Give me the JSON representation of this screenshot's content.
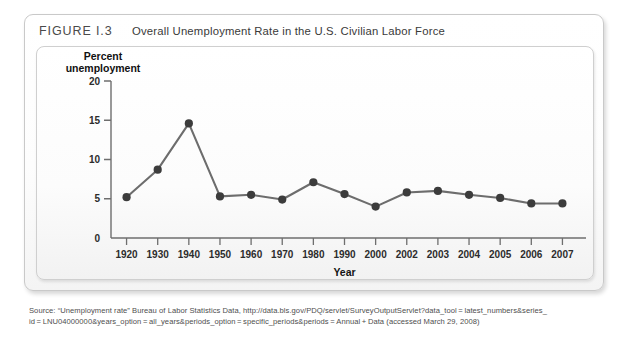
{
  "figure": {
    "number": "FIGURE I.3",
    "title": "Overall Unemployment Rate in the U.S. Civilian Labor Force"
  },
  "source": {
    "line1": "Source: “Unemployment rate” Bureau of Labor Statistics Data, http://data.bls.gov/PDQ/servlet/SurveyOutputServlet?data_tool = latest_numbers&series_",
    "line2": "id = LNU04000000&years_option = all_years&periods_option = specific_periods&periods = Annual + Data (accessed March 29, 2008)"
  },
  "colors": {
    "line": "#6d6d6d",
    "marker": "#3c3c3c",
    "axis": "#6e6e6e",
    "frame_border": "#c9c9c9",
    "panel_border": "#cfcfcf"
  },
  "chart_data": {
    "type": "line",
    "title": "Overall Unemployment Rate in the U.S. Civilian Labor Force",
    "xlabel": "Year",
    "ylabel": "Percent unemployment",
    "ylabel_line1": "Percent",
    "ylabel_line2": "unemployment",
    "categories": [
      "1920",
      "1930",
      "1940",
      "1950",
      "1960",
      "1970",
      "1980",
      "1990",
      "2000",
      "2002",
      "2003",
      "2004",
      "2005",
      "2006",
      "2007"
    ],
    "values": [
      5.2,
      8.7,
      14.6,
      5.3,
      5.5,
      4.9,
      7.1,
      5.6,
      4.0,
      5.8,
      6.0,
      5.5,
      5.1,
      4.4,
      4.4
    ],
    "ylim": [
      0,
      20
    ],
    "yticks": [
      0,
      5,
      10,
      15,
      20
    ],
    "ytick_labels": [
      "0",
      "5",
      "10",
      "15",
      "20"
    ],
    "grid": false,
    "legend": "none",
    "marker": "circle"
  }
}
